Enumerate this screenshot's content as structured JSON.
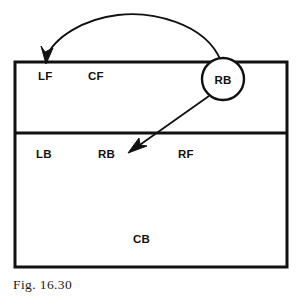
{
  "figure": {
    "caption": "Fig. 16.30",
    "background_color": "#ffffff",
    "line_color": "#111111"
  },
  "zones": {
    "front_row_labels": [
      {
        "text": "LF",
        "x": 38,
        "y": 80
      },
      {
        "text": "CF",
        "x": 88,
        "y": 80
      }
    ],
    "back_row_labels": [
      {
        "text": "LB",
        "x": 36,
        "y": 158
      },
      {
        "text": "RB",
        "x": 98,
        "y": 158
      },
      {
        "text": "RF",
        "x": 178,
        "y": 158
      }
    ],
    "bottom_labels": [
      {
        "text": "CB",
        "x": 133,
        "y": 243
      }
    ]
  },
  "marker": {
    "label": "RB",
    "center_x": 223,
    "center_y": 79,
    "radius": 21
  },
  "arrows": {
    "curved": {
      "name": "curved-movement-arrow",
      "from_x": 221,
      "from_y": 60,
      "to_x": 46,
      "to_y": 61,
      "apex_x": 128,
      "apex_y": 12
    },
    "straight": {
      "name": "straight-movement-arrow",
      "from_x": 208,
      "from_y": 96,
      "to_x": 129,
      "to_y": 153
    }
  },
  "field": {
    "left": 15,
    "right": 287,
    "top": 62,
    "divider": 133,
    "bottom": 267
  }
}
